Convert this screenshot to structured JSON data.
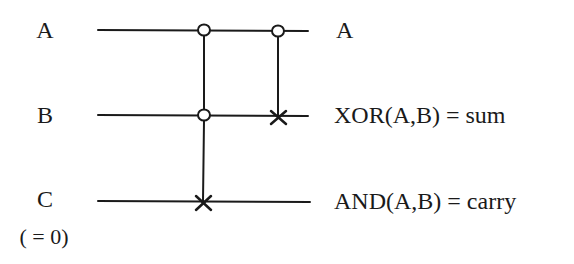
{
  "diagram": {
    "type": "reversible-circuit",
    "inputs": [
      {
        "id": "A",
        "label": "A",
        "sublabel": ""
      },
      {
        "id": "B",
        "label": "B",
        "sublabel": ""
      },
      {
        "id": "C",
        "label": "C",
        "sublabel": "( = 0)"
      }
    ],
    "outputs": [
      {
        "wire": "A",
        "label": "A"
      },
      {
        "wire": "B",
        "label": "XOR(A,B) = sum"
      },
      {
        "wire": "C",
        "label": "AND(A,B) = carry"
      }
    ],
    "gates": [
      {
        "name": "Toffoli",
        "controls": [
          "A",
          "B"
        ],
        "target": "C",
        "control_symbol": "open-circle",
        "target_symbol": "cross"
      },
      {
        "name": "CNOT",
        "controls": [
          "A"
        ],
        "target": "B",
        "control_symbol": "open-circle",
        "target_symbol": "cross"
      }
    ],
    "colors": {
      "line": "#1a1a1a",
      "background": "#ffffff"
    }
  }
}
